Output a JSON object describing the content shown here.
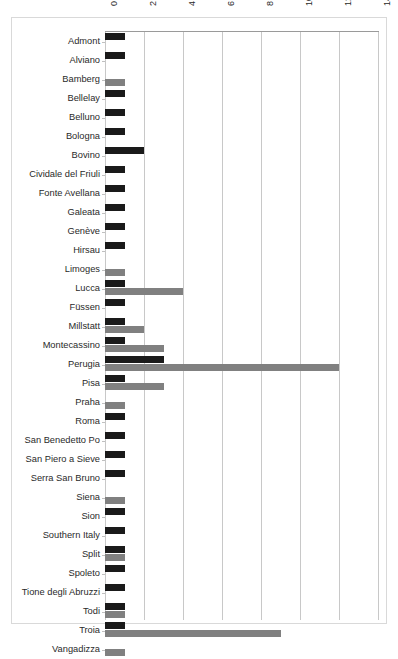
{
  "chart_data": {
    "type": "bar",
    "orientation": "horizontal",
    "title": "",
    "subtitle": "",
    "xlabel": "",
    "ylabel": "",
    "xlim": [
      0,
      14
    ],
    "ylim": null,
    "grid": true,
    "grid_axis": "x",
    "legend": false,
    "legend_position": "none",
    "xticks": [
      0,
      2,
      4,
      6,
      8,
      10,
      12,
      14
    ],
    "xtick_labels": [
      "0",
      "2",
      "4",
      "6",
      "8",
      "10",
      "12",
      "14"
    ],
    "xtick_rotation": 90,
    "categories": [
      "Admont",
      "Alviano",
      "Bamberg",
      "Bellelay",
      "Belluno",
      "Bologna",
      "Bovino",
      "Cividale del Friuli",
      "Fonte Avellana",
      "Galeata",
      "Genève",
      "Hirsau",
      "Limoges",
      "Lucca",
      "Füssen",
      "Millstatt",
      "Montecassino",
      "Perugia",
      "Pisa",
      "Praha",
      "Roma",
      "San Benedetto Po",
      "San Piero a Sieve",
      "Serra San Bruno",
      "Siena",
      "Sion",
      "Southern Italy",
      "Split",
      "Spoleto",
      "Tione degli Abruzzi",
      "Todi",
      "Troia",
      "Vangadizza"
    ],
    "series": [
      {
        "name": "series-1",
        "color": "#1a1a1a",
        "values": [
          1,
          1,
          0,
          1,
          1,
          1,
          2,
          1,
          1,
          1,
          1,
          1,
          0,
          1,
          1,
          1,
          1,
          3,
          1,
          0,
          1,
          1,
          1,
          1,
          0,
          1,
          1,
          1,
          1,
          1,
          1,
          1,
          0
        ]
      },
      {
        "name": "series-2",
        "color": "#808080",
        "values": [
          0,
          0,
          1,
          0,
          0,
          0,
          0,
          0,
          0,
          0,
          0,
          0,
          1,
          4,
          0,
          2,
          3,
          12,
          3,
          1,
          0,
          0,
          0,
          0,
          1,
          0,
          0,
          1,
          0,
          0,
          1,
          9,
          1
        ]
      }
    ]
  },
  "colors": {
    "series_1": "#1a1a1a",
    "series_2": "#808080",
    "gridline": "#c8c8c8",
    "axis_line": "#9a9a9a",
    "frame": "#d9d9d9",
    "background": "#ffffff",
    "label_text": "#2a2a2a"
  }
}
